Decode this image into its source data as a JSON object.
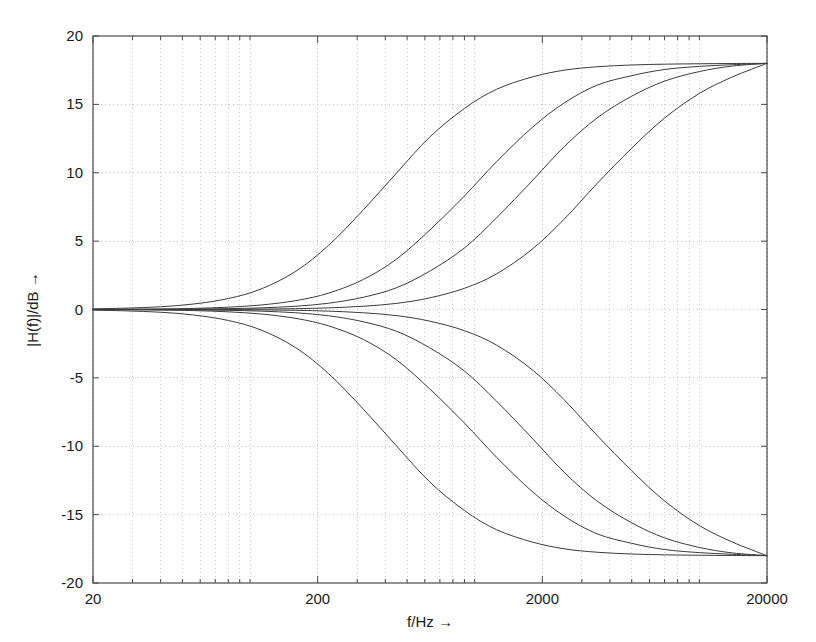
{
  "chart_data": {
    "type": "line",
    "title": "",
    "subtitle": "",
    "xlabel": "f/Hz →",
    "ylabel": "|H(f)|/dB →",
    "xscale": "log",
    "yscale": "linear",
    "xlim": [
      20,
      20000
    ],
    "ylim": [
      -20,
      20
    ],
    "xticks": [
      20,
      200,
      2000,
      20000
    ],
    "xticklabels": [
      "20",
      "200",
      "2000",
      "20000"
    ],
    "yticks": [
      -20,
      -15,
      -10,
      -5,
      0,
      5,
      10,
      15,
      20
    ],
    "yticklabels": [
      "-20",
      "-15",
      "-10",
      "-5",
      "0",
      "5",
      "10",
      "15",
      "20"
    ],
    "grid": true,
    "grid_style": "dotted",
    "grid_minor": true,
    "legend": "none",
    "line_color": "#3c3c3c",
    "axes_color": "#4a4a4a",
    "grid_color": "#b9b9b9",
    "background": "#ffffff",
    "annotations": [],
    "plateau_gain_db": 18,
    "series": [
      {
        "name": "boost-shelf-1",
        "gain_db": 18,
        "corner_hz": 400,
        "x": [
          20,
          28,
          40,
          56,
          80,
          112,
          160,
          224,
          320,
          450,
          630,
          900,
          1250,
          1800,
          2500,
          3500,
          5000,
          7000,
          10000,
          14000,
          20000
        ],
        "y": [
          0.05,
          0.1,
          0.2,
          0.4,
          0.8,
          1.5,
          2.8,
          4.7,
          7.3,
          10.0,
          12.6,
          14.7,
          16.1,
          17.0,
          17.5,
          17.75,
          17.88,
          17.94,
          17.97,
          17.99,
          18.0
        ]
      },
      {
        "name": "boost-shelf-2",
        "gain_db": 18,
        "corner_hz": 1200,
        "x": [
          20,
          28,
          40,
          56,
          80,
          112,
          160,
          224,
          320,
          450,
          630,
          900,
          1250,
          1800,
          2500,
          3500,
          5000,
          7000,
          10000,
          14000,
          20000
        ],
        "y": [
          0.01,
          0.02,
          0.04,
          0.08,
          0.17,
          0.33,
          0.65,
          1.2,
          2.2,
          3.7,
          5.8,
          8.3,
          10.8,
          13.3,
          15.1,
          16.4,
          17.1,
          17.55,
          17.78,
          17.9,
          18.0
        ]
      },
      {
        "name": "boost-shelf-3",
        "gain_db": 18,
        "corner_hz": 2200,
        "x": [
          20,
          28,
          40,
          56,
          80,
          112,
          160,
          224,
          320,
          450,
          630,
          900,
          1250,
          1800,
          2500,
          3500,
          5000,
          7000,
          10000,
          14000,
          20000
        ],
        "y": [
          0.004,
          0.008,
          0.015,
          0.03,
          0.06,
          0.12,
          0.24,
          0.46,
          0.9,
          1.6,
          2.8,
          4.5,
          6.7,
          9.4,
          11.9,
          14.0,
          15.6,
          16.7,
          17.4,
          17.8,
          18.0
        ]
      },
      {
        "name": "boost-shelf-4",
        "gain_db": 18,
        "corner_hz": 5000,
        "x": [
          20,
          28,
          40,
          56,
          80,
          112,
          160,
          224,
          320,
          450,
          630,
          900,
          1250,
          1800,
          2500,
          3500,
          5000,
          7000,
          10000,
          14000,
          20000
        ],
        "y": [
          0.001,
          0.002,
          0.004,
          0.008,
          0.016,
          0.03,
          0.06,
          0.12,
          0.24,
          0.45,
          0.85,
          1.55,
          2.6,
          4.4,
          6.6,
          9.2,
          11.8,
          14.0,
          15.8,
          17.0,
          18.0
        ]
      },
      {
        "name": "cut-shelf-1",
        "gain_db": -18,
        "corner_hz": 400,
        "x": [
          20,
          28,
          40,
          56,
          80,
          112,
          160,
          224,
          320,
          450,
          630,
          900,
          1250,
          1800,
          2500,
          3500,
          5000,
          7000,
          10000,
          14000,
          20000
        ],
        "y": [
          -0.05,
          -0.1,
          -0.2,
          -0.4,
          -0.8,
          -1.5,
          -2.8,
          -4.7,
          -7.3,
          -10.0,
          -12.6,
          -14.7,
          -16.1,
          -17.0,
          -17.5,
          -17.75,
          -17.88,
          -17.94,
          -17.97,
          -17.99,
          -18.0
        ]
      },
      {
        "name": "cut-shelf-2",
        "gain_db": -18,
        "corner_hz": 1200,
        "x": [
          20,
          28,
          40,
          56,
          80,
          112,
          160,
          224,
          320,
          450,
          630,
          900,
          1250,
          1800,
          2500,
          3500,
          5000,
          7000,
          10000,
          14000,
          20000
        ],
        "y": [
          -0.01,
          -0.02,
          -0.04,
          -0.08,
          -0.17,
          -0.33,
          -0.65,
          -1.2,
          -2.2,
          -3.7,
          -5.8,
          -8.3,
          -10.8,
          -13.3,
          -15.1,
          -16.4,
          -17.1,
          -17.55,
          -17.78,
          -17.9,
          -18.0
        ]
      },
      {
        "name": "cut-shelf-3",
        "gain_db": -18,
        "corner_hz": 2200,
        "x": [
          20,
          28,
          40,
          56,
          80,
          112,
          160,
          224,
          320,
          450,
          630,
          900,
          1250,
          1800,
          2500,
          3500,
          5000,
          7000,
          10000,
          14000,
          20000
        ],
        "y": [
          -0.004,
          -0.008,
          -0.015,
          -0.03,
          -0.06,
          -0.12,
          -0.24,
          -0.46,
          -0.9,
          -1.6,
          -2.8,
          -4.5,
          -6.7,
          -9.4,
          -11.9,
          -14.0,
          -15.6,
          -16.7,
          -17.4,
          -17.8,
          -18.0
        ]
      },
      {
        "name": "cut-shelf-4",
        "gain_db": -18,
        "corner_hz": 5000,
        "x": [
          20,
          28,
          40,
          56,
          80,
          112,
          160,
          224,
          320,
          450,
          630,
          900,
          1250,
          1800,
          2500,
          3500,
          5000,
          7000,
          10000,
          14000,
          20000
        ],
        "y": [
          -0.001,
          -0.002,
          -0.004,
          -0.008,
          -0.016,
          -0.03,
          -0.06,
          -0.12,
          -0.24,
          -0.45,
          -0.85,
          -1.55,
          -2.6,
          -4.4,
          -6.6,
          -9.2,
          -11.8,
          -14.0,
          -15.8,
          -17.0,
          -18.0
        ]
      }
    ]
  },
  "layout": {
    "plot_left": 93,
    "plot_top": 36,
    "plot_right": 767,
    "plot_bottom": 583
  }
}
